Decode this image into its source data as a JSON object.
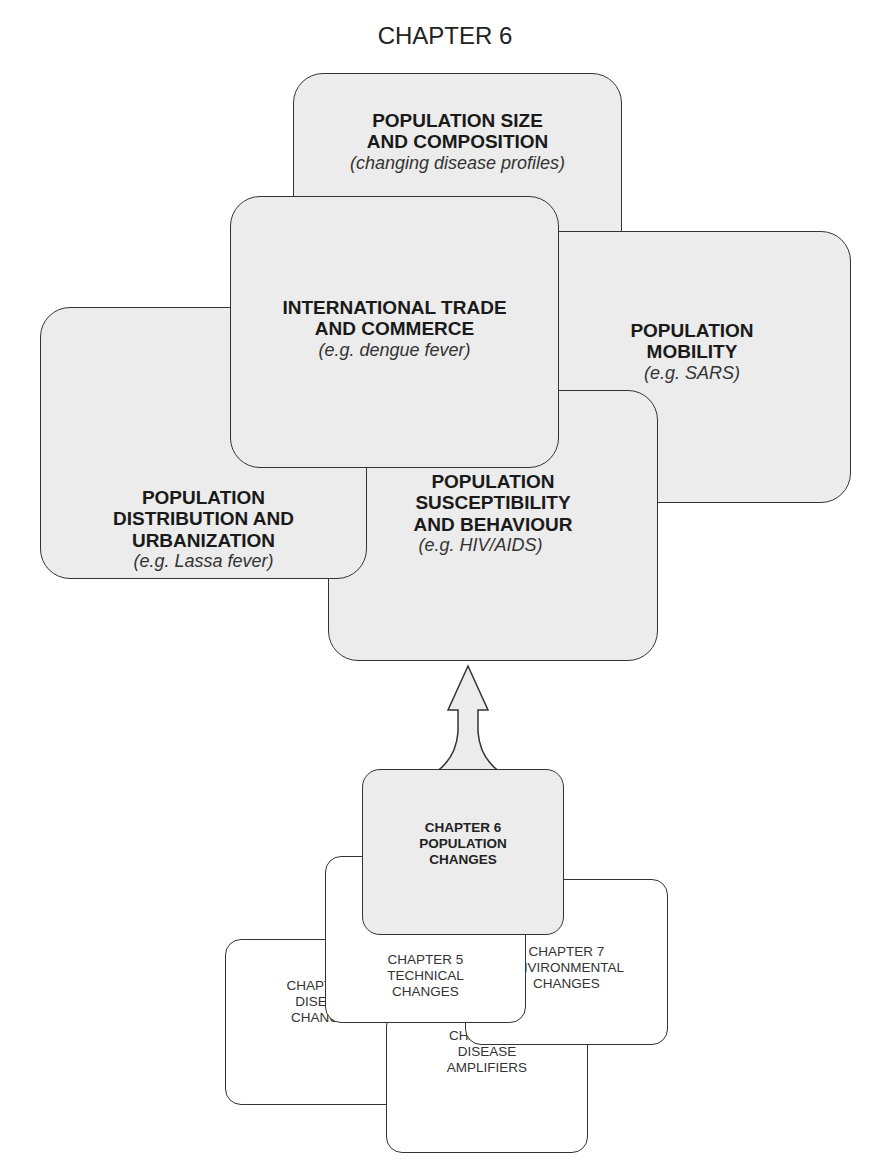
{
  "title": "CHAPTER 6",
  "factors": [
    {
      "id": "size",
      "title_lines": [
        "POPULATION SIZE",
        "AND COMPOSITION"
      ],
      "example": "(changing disease profiles)"
    },
    {
      "id": "mobility",
      "title_lines": [
        "POPULATION",
        "MOBILITY"
      ],
      "example": "(e.g. SARS)"
    },
    {
      "id": "trade",
      "title_lines": [
        "INTERNATIONAL TRADE",
        "AND COMMERCE"
      ],
      "example": "(e.g. dengue fever)"
    },
    {
      "id": "distribution",
      "title_lines": [
        "POPULATION",
        "DISTRIBUTION AND",
        "URBANIZATION"
      ],
      "example": "(e.g. Lassa fever)"
    },
    {
      "id": "susceptibility",
      "title_lines": [
        "POPULATION",
        "SUSCEPTIBILITY",
        "AND BEHAVIOUR"
      ],
      "example": "(e.g. HIV/AIDS)"
    }
  ],
  "chapters": [
    {
      "id": "ch6",
      "lines": [
        "CHAPTER 6",
        "POPULATION",
        "CHANGES"
      ],
      "highlighted": true
    },
    {
      "id": "ch5",
      "lines": [
        "CHAPTER 5",
        "TECHNICAL",
        "CHANGES"
      ]
    },
    {
      "id": "ch7",
      "lines": [
        "CHAPTER 7",
        "ENVIRONMENTAL",
        "CHANGES"
      ]
    },
    {
      "id": "ch4",
      "lines": [
        "CHAPTER 4",
        "DISEASE",
        "CHANGES"
      ]
    },
    {
      "id": "ch8",
      "lines": [
        "CHAPTER 8",
        "DISEASE",
        "AMPLIFIERS"
      ]
    }
  ],
  "colors": {
    "box_fill": "#ececec",
    "outline": "#333333",
    "white_fill": "#ffffff"
  }
}
